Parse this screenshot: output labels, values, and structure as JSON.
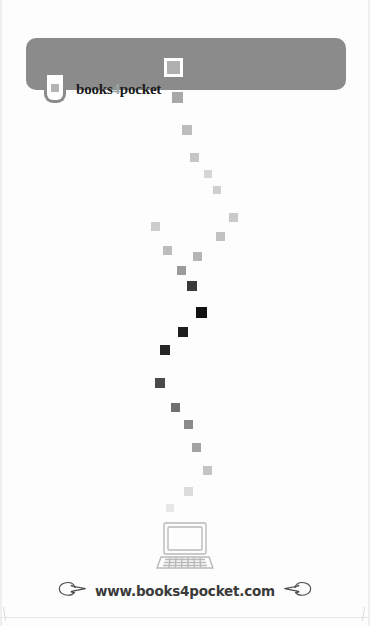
{
  "page": {
    "background_color": "#fdfdfd",
    "width": 370,
    "height": 626
  },
  "header": {
    "bar_color": "#8b8b8b",
    "logo": {
      "badge_icon": "rounded-pocket-badge-icon",
      "badge_square_color": "#b4b4b4",
      "wordmark_prefix": "books",
      "wordmark_number": "4",
      "wordmark_suffix": "pocket",
      "wordmark_full": "books4pocket",
      "number_color": "#9aa6a6",
      "text_color": "#1b1b1b"
    }
  },
  "trail": {
    "description": "descending trail of squares fading from light gray to black and back to light gray",
    "squares": [
      {
        "x": 167,
        "y": 61,
        "size": 13,
        "color": "#b0b0b0",
        "ring": "#ffffff"
      },
      {
        "x": 172,
        "y": 92,
        "size": 11,
        "color": "#a8a8a8",
        "ring": "none"
      },
      {
        "x": 182,
        "y": 125,
        "size": 10,
        "color": "#bdbdbd",
        "ring": "none"
      },
      {
        "x": 190,
        "y": 153,
        "size": 9,
        "color": "#c6c6c6",
        "ring": "none"
      },
      {
        "x": 204,
        "y": 170,
        "size": 8,
        "color": "#d6d6d6",
        "ring": "none"
      },
      {
        "x": 213,
        "y": 186,
        "size": 8,
        "color": "#cfcfcf",
        "ring": "none"
      },
      {
        "x": 229,
        "y": 213,
        "size": 9,
        "color": "#c9c9c9",
        "ring": "none"
      },
      {
        "x": 216,
        "y": 232,
        "size": 9,
        "color": "#c2c2c2",
        "ring": "none"
      },
      {
        "x": 151,
        "y": 222,
        "size": 9,
        "color": "#cccccc",
        "ring": "none"
      },
      {
        "x": 163,
        "y": 246,
        "size": 9,
        "color": "#bdbdbd",
        "ring": "none"
      },
      {
        "x": 193,
        "y": 252,
        "size": 9,
        "color": "#b5b5b5",
        "ring": "none"
      },
      {
        "x": 177,
        "y": 266,
        "size": 9,
        "color": "#9b9b9b",
        "ring": "none"
      },
      {
        "x": 187,
        "y": 281,
        "size": 10,
        "color": "#3a3a3a",
        "ring": "none"
      },
      {
        "x": 196,
        "y": 307,
        "size": 11,
        "color": "#111111",
        "ring": "none"
      },
      {
        "x": 178,
        "y": 327,
        "size": 10,
        "color": "#1d1d1d",
        "ring": "none"
      },
      {
        "x": 160,
        "y": 345,
        "size": 10,
        "color": "#262626",
        "ring": "none"
      },
      {
        "x": 155,
        "y": 378,
        "size": 10,
        "color": "#4a4a4a",
        "ring": "none"
      },
      {
        "x": 171,
        "y": 403,
        "size": 9,
        "color": "#6f6f6f",
        "ring": "none"
      },
      {
        "x": 184,
        "y": 420,
        "size": 9,
        "color": "#8a8a8a",
        "ring": "none"
      },
      {
        "x": 192,
        "y": 443,
        "size": 9,
        "color": "#a3a3a3",
        "ring": "none"
      },
      {
        "x": 203,
        "y": 466,
        "size": 9,
        "color": "#c4c4c4",
        "ring": "none"
      },
      {
        "x": 184,
        "y": 487,
        "size": 9,
        "color": "#dcdcdc",
        "ring": "none"
      },
      {
        "x": 166,
        "y": 504,
        "size": 8,
        "color": "#e8e8e8",
        "ring": "none"
      }
    ]
  },
  "laptop": {
    "icon": "laptop-computer-icon",
    "stroke_color": "#b9b9b9"
  },
  "footer": {
    "url": "www.books4pocket.com",
    "left_icon": "pointing-hand-right-icon",
    "right_icon": "pointing-hand-left-icon",
    "text_color": "#3a3a3a"
  }
}
